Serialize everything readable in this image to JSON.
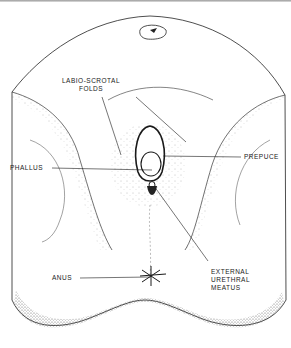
{
  "diagram": {
    "type": "anatomical-illustration",
    "labels": {
      "labio_scrotal_folds": [
        "LABIO-SCROTAL",
        "FOLDS"
      ],
      "phallus": "PHALLUS",
      "prepuce": "PREPUCE",
      "anus": "ANUS",
      "external_urethral_meatus": [
        "EXTERNAL",
        "URETHRAL",
        "MEATUS"
      ]
    },
    "colors": {
      "ink": "#1a1a1a",
      "background": "#ffffff"
    }
  }
}
